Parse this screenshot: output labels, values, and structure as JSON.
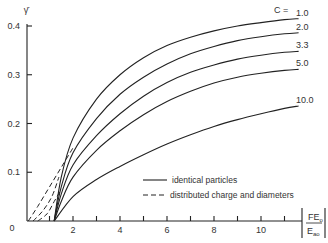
{
  "chart_data": {
    "type": "line",
    "title": "",
    "ylabel": "γ̄",
    "xlabel": "|FE_o / E_ao|",
    "xlim": [
      0,
      11.5
    ],
    "ylim": [
      0,
      0.4
    ],
    "x_ticks": [
      2,
      4,
      6,
      8,
      10
    ],
    "y_ticks": [
      0,
      0.1,
      0.2,
      0.3,
      0.4
    ],
    "y_tick_labels": [
      "0",
      "0.1",
      "0.2",
      "0.3",
      "0.4"
    ],
    "grid": false,
    "parameter_label": "C =",
    "series": [
      {
        "name": "1.0",
        "style": "solid",
        "x": [
          1.2,
          1.5,
          2,
          3,
          4,
          5,
          6,
          7,
          8,
          9,
          10,
          11,
          11.6
        ],
        "values": [
          0,
          0.09,
          0.17,
          0.25,
          0.3,
          0.335,
          0.36,
          0.377,
          0.39,
          0.4,
          0.407,
          0.413,
          0.415
        ]
      },
      {
        "name": "2.0",
        "style": "solid",
        "x": [
          1.2,
          1.5,
          2,
          3,
          4,
          5,
          6,
          7,
          8,
          9,
          10,
          11,
          11.6
        ],
        "values": [
          0,
          0.07,
          0.14,
          0.21,
          0.26,
          0.295,
          0.322,
          0.343,
          0.358,
          0.37,
          0.378,
          0.384,
          0.386
        ]
      },
      {
        "name": "3.3",
        "style": "solid",
        "x": [
          1.2,
          1.5,
          2,
          3,
          4,
          5,
          6,
          7,
          8,
          9,
          10,
          11,
          11.6
        ],
        "values": [
          0,
          0.055,
          0.115,
          0.175,
          0.22,
          0.256,
          0.284,
          0.305,
          0.32,
          0.332,
          0.34,
          0.346,
          0.348
        ]
      },
      {
        "name": "5.0",
        "style": "solid",
        "x": [
          1.2,
          1.5,
          2,
          3,
          4,
          5,
          6,
          7,
          8,
          9,
          10,
          11,
          11.6
        ],
        "values": [
          0,
          0.04,
          0.09,
          0.145,
          0.185,
          0.218,
          0.245,
          0.266,
          0.283,
          0.295,
          0.303,
          0.309,
          0.311
        ]
      },
      {
        "name": "10.0",
        "style": "solid",
        "x": [
          1.2,
          2,
          3,
          4,
          5,
          6,
          7,
          8,
          9,
          10,
          11,
          11.6
        ],
        "values": [
          0,
          0.05,
          0.085,
          0.112,
          0.136,
          0.158,
          0.177,
          0.194,
          0.208,
          0.22,
          0.231,
          0.236
        ]
      },
      {
        "name": "distributed-1",
        "style": "dashed",
        "x": [
          0.1,
          0.5,
          1.0,
          1.5,
          2.0
        ],
        "values": [
          0,
          0.03,
          0.07,
          0.11,
          0.15
        ]
      },
      {
        "name": "distributed-2",
        "style": "dashed",
        "x": [
          0.3,
          0.7,
          1.1,
          1.4
        ],
        "values": [
          0,
          0.02,
          0.05,
          0.09
        ]
      },
      {
        "name": "distributed-3",
        "style": "dashed",
        "x": [
          0.5,
          0.9,
          1.2,
          1.5
        ],
        "values": [
          0,
          0.015,
          0.04,
          0.065
        ]
      }
    ],
    "legend": [
      {
        "style": "solid",
        "label": "identical particles"
      },
      {
        "style": "dashed",
        "label": "distributed charge and diameters"
      }
    ],
    "legend_position": "lower-right-inside"
  },
  "labels": {
    "y_axis_symbol": "γ̄",
    "x_axis_num": "FE",
    "x_axis_num_sub": "o",
    "x_axis_den": "E",
    "x_axis_den_sub": "ao",
    "c_prefix": "C =",
    "x0": "0"
  }
}
